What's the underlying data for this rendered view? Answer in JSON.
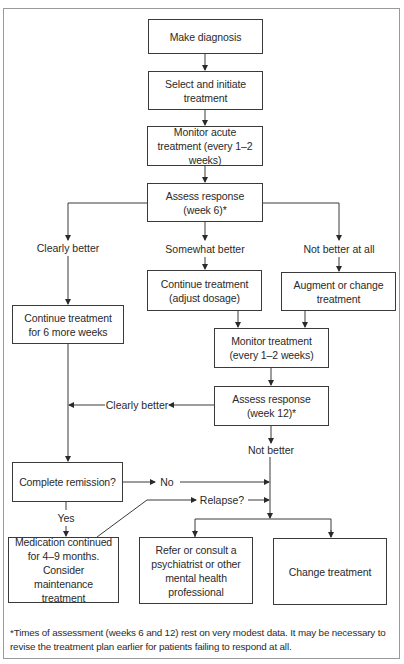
{
  "figure": {
    "label_fragment": "g",
    "footnote": "*Times of assessment (weeks 6 and 12) rest on very modest data. It may be necessary to revise the treatment plan earlier for patients failing to respond at all."
  },
  "nodes": {
    "make_diagnosis": "Make diagnosis",
    "select_initiate": "Select and initiate treatment",
    "monitor_acute": "Monitor acute treatment (every 1–2 weeks)",
    "assess_week6": "Assess response (week 6)*",
    "continue_6_weeks": "Continue treatment for 6 more weeks",
    "continue_adjust": "Continue treatment (adjust dosage)",
    "augment_change": "Augment or change treatment",
    "monitor_treatment": "Monitor treatment (every 1–2 weeks)",
    "assess_week12": "Assess response (week 12)*",
    "complete_remission": "Complete remission?",
    "medication_continued": "Medication continued for 4–9 months. Consider maintenance treatment",
    "refer_consult": "Refer or consult a psychiatrist or other mental health professional",
    "change_treatment": "Change treatment"
  },
  "edge_labels": {
    "clearly_better_w6": "Clearly better",
    "somewhat_better": "Somewhat better",
    "not_better_at_all": "Not better at all",
    "clearly_better_w12": "Clearly better",
    "not_better": "Not better",
    "no": "No",
    "yes": "Yes",
    "relapse": "Relapse?"
  }
}
